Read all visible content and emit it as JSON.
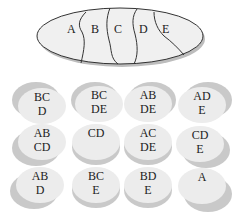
{
  "main_ellipse": {
    "regions": [
      "A",
      "B",
      "C",
      "D",
      "E"
    ],
    "fill": "#f0f0f0",
    "stroke": "#333333",
    "shadow": "#bdbdbd"
  },
  "discs": [
    {
      "line1": "BC",
      "line2": "D",
      "shadow": "top-left"
    },
    {
      "line1": "BC",
      "line2": "DE",
      "shadow": "top-left"
    },
    {
      "line1": "AB",
      "line2": "DE",
      "shadow": "top-left"
    },
    {
      "line1": "AD",
      "line2": "E",
      "shadow": "top-right"
    },
    {
      "line1": "AB",
      "line2": "CD",
      "shadow": "bottom-left"
    },
    {
      "line1": "CD",
      "line2": "",
      "shadow": "bottom"
    },
    {
      "line1": "AC",
      "line2": "DE",
      "shadow": "bottom"
    },
    {
      "line1": "CD",
      "line2": "E",
      "shadow": "bottom-right"
    },
    {
      "line1": "AB",
      "line2": "D",
      "shadow": "bottom-left"
    },
    {
      "line1": "BC",
      "line2": "E",
      "shadow": "bottom"
    },
    {
      "line1": "BD",
      "line2": "E",
      "shadow": "bottom"
    },
    {
      "line1": "A",
      "line2": "",
      "shadow": "bottom-right"
    }
  ]
}
